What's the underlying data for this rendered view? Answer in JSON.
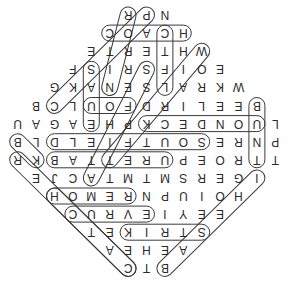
{
  "puzzle": {
    "type": "word-search",
    "shape": "diamond",
    "orientation": "rotated-180",
    "grid_rows": [
      {
        "letters": "RPN"
      },
      {
        "letters": "COACH"
      },
      {
        "letters": "ETRETHW"
      },
      {
        "letters": "FSIRSFIOE"
      },
      {
        "letters": "GKANESLARKW"
      },
      {
        "letters": "BCLUOFDRILEEB"
      },
      {
        "letters": "UAGAEHPKCEDNOUL"
      },
      {
        "letters": "BLDLEIFTUOSERNP"
      },
      {
        "letters": "RKBATTERUPEORTT"
      },
      {
        "letters": "EJCATMTMSREGI"
      },
      {
        "letters": "HOMERNPUIOH"
      },
      {
        "letters": "CURVEIYEE"
      },
      {
        "letters": "TEKIRTS"
      },
      {
        "letters": "AEHEA"
      },
      {
        "letters": "CTB"
      }
    ],
    "found_words": [
      "COACH",
      "HOMER",
      "CURVE",
      "STRIKE",
      "BATTER UP",
      "OUTFIELD",
      "ON DECK",
      "FOUL",
      "PITCHER",
      "HOME RUN",
      "BASES",
      "STEAL",
      "WORLD SERIES",
      "BULLPEN"
    ],
    "colors": {
      "letter": "#2a2a2a",
      "outline": "#3a3a3a",
      "background": "#ffffff"
    }
  }
}
